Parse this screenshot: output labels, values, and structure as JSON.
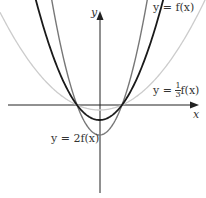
{
  "figure": {
    "axes": {
      "x_label": "x",
      "y_label": "y"
    },
    "curves": [
      {
        "name": "f",
        "label": "y = f(x)",
        "color": "#1a1a1a",
        "scale": 1
      },
      {
        "name": "two_f",
        "label": "y = 2f(x)",
        "color": "#777777",
        "scale": 2
      },
      {
        "name": "third_f",
        "label": "y = 1/3 f(x)",
        "color": "#cccccc",
        "scale": 0.3333
      }
    ],
    "labels": {
      "f": "y = f(x)",
      "two_f": "y = 2f(x)",
      "third_f_prefix": "y = ",
      "third_f_num": "1",
      "third_f_den": "3",
      "third_f_suffix": "f(x)"
    }
  }
}
